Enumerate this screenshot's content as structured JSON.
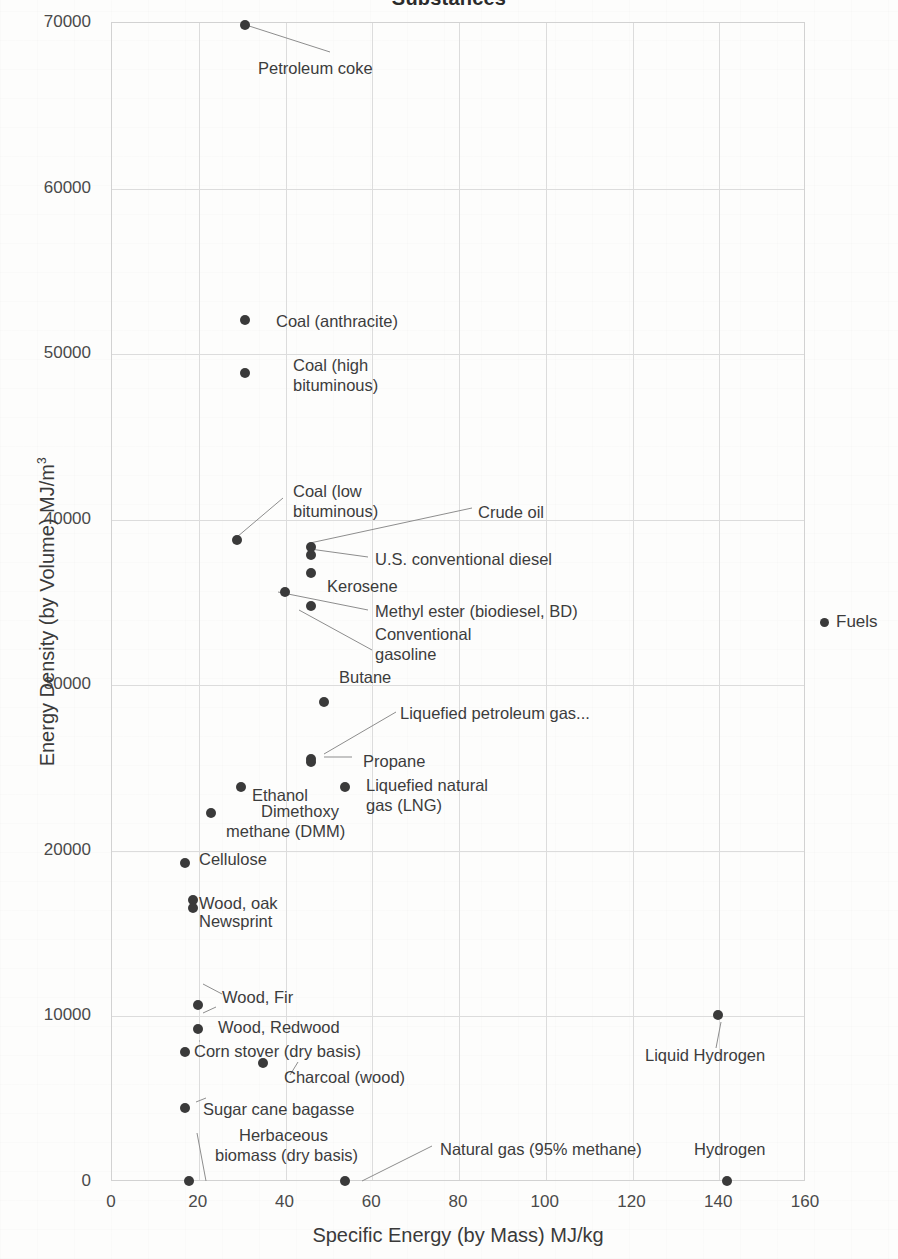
{
  "chart_data": {
    "type": "scatter",
    "title": "Substances",
    "xlabel": "Specific Energy  (by Mass)   MJ/kg",
    "ylabel": "Energy Density (by Volume)   MJ/m",
    "ylabel_sup": "3",
    "xlim": [
      0,
      160
    ],
    "ylim": [
      0,
      70000
    ],
    "xticks": [
      0,
      20,
      40,
      60,
      80,
      100,
      120,
      140,
      160
    ],
    "yticks": [
      0,
      10000,
      20000,
      30000,
      40000,
      50000,
      60000,
      70000
    ],
    "grid": true,
    "legend": {
      "position": "right",
      "entries": [
        "Fuels"
      ]
    },
    "series": [
      {
        "name": "Fuels",
        "color": "#3a3a3a",
        "points": [
          {
            "label": "Petroleum coke",
            "x": 31,
            "y": 69800
          },
          {
            "label": "Coal (anthracite)",
            "x": 31,
            "y": 52000
          },
          {
            "label": "Coal (high\nbituminous)",
            "x": 31,
            "y": 48800
          },
          {
            "label": "Coal (low\nbituminous)",
            "x": 29,
            "y": 38700
          },
          {
            "label": "Crude oil",
            "x": 46,
            "y": 38300
          },
          {
            "label": "U.S. conventional diesel",
            "x": 46,
            "y": 37800
          },
          {
            "label": "Kerosene",
            "x": 46,
            "y": 36700
          },
          {
            "label": "Methyl ester (biodiesel, BD)",
            "x": 40,
            "y": 35600
          },
          {
            "label": "Conventional\ngasoline",
            "x": 46,
            "y": 34700
          },
          {
            "label": "Butane",
            "x": 49,
            "y": 28900
          },
          {
            "label": "Liquefied petroleum gas...",
            "x": 46,
            "y": 25500
          },
          {
            "label": "Propane",
            "x": 46,
            "y": 25300
          },
          {
            "label": "Liquefied natural\ngas (LNG)",
            "x": 54,
            "y": 23800
          },
          {
            "label": "Ethanol",
            "x": 30,
            "y": 23800
          },
          {
            "label": "Dimethoxy\nmethane (DMM)",
            "x": 23,
            "y": 22200
          },
          {
            "label": "Cellulose",
            "x": 17,
            "y": 19200
          },
          {
            "label": "Wood, oak",
            "x": 19,
            "y": 17000
          },
          {
            "label": "Newsprint",
            "x": 19,
            "y": 16500
          },
          {
            "label": "Wood, Fir",
            "x": 20,
            "y": 10600
          },
          {
            "label": "Wood, Redwood",
            "x": 20,
            "y": 9200
          },
          {
            "label": "Corn stover (dry basis)",
            "x": 17,
            "y": 7800
          },
          {
            "label": "Charcoal (wood)",
            "x": 35,
            "y": 7100
          },
          {
            "label": "Liquid Hydrogen",
            "x": 140,
            "y": 10000
          },
          {
            "label": "Sugar cane bagasse",
            "x": 17,
            "y": 4400
          },
          {
            "label": "Herbaceous\nbiomass (dry basis)",
            "x": 18,
            "y": 0
          },
          {
            "label": "Natural gas (95% methane)",
            "x": 54,
            "y": 0
          },
          {
            "label": "Hydrogen",
            "x": 142,
            "y": 0
          }
        ]
      }
    ],
    "annotations": [
      {
        "text": "Petroleum coke",
        "x_px": 258,
        "y_px": 59,
        "align": "left"
      },
      {
        "text": "Coal (anthracite)",
        "x_px": 276,
        "y_px": 312,
        "align": "left"
      },
      {
        "text": "Coal (high",
        "x_px": 293,
        "y_px": 356,
        "align": "left"
      },
      {
        "text": "bituminous)",
        "x_px": 293,
        "y_px": 376,
        "align": "left"
      },
      {
        "text": "Coal (low",
        "x_px": 293,
        "y_px": 482,
        "align": "left"
      },
      {
        "text": "bituminous)",
        "x_px": 293,
        "y_px": 502,
        "align": "left"
      },
      {
        "text": "Crude oil",
        "x_px": 478,
        "y_px": 503,
        "align": "left"
      },
      {
        "text": "U.S. conventional diesel",
        "x_px": 375,
        "y_px": 550,
        "align": "left"
      },
      {
        "text": "Kerosene",
        "x_px": 327,
        "y_px": 577,
        "align": "left"
      },
      {
        "text": "Methyl ester (biodiesel, BD)",
        "x_px": 375,
        "y_px": 602,
        "align": "left"
      },
      {
        "text": "Conventional",
        "x_px": 375,
        "y_px": 625,
        "align": "left"
      },
      {
        "text": "gasoline",
        "x_px": 375,
        "y_px": 645,
        "align": "left"
      },
      {
        "text": "Butane",
        "x_px": 339,
        "y_px": 668,
        "align": "left"
      },
      {
        "text": "Liquefied petroleum gas...",
        "x_px": 400,
        "y_px": 704,
        "align": "left"
      },
      {
        "text": "Propane",
        "x_px": 363,
        "y_px": 752,
        "align": "left"
      },
      {
        "text": "Liquefied natural",
        "x_px": 366,
        "y_px": 776,
        "align": "left"
      },
      {
        "text": "gas (LNG)",
        "x_px": 366,
        "y_px": 796,
        "align": "left"
      },
      {
        "text": "Ethanol",
        "x_px": 252,
        "y_px": 786,
        "align": "left"
      },
      {
        "text": "Dimethoxy",
        "x_px": 261,
        "y_px": 802,
        "align": "left"
      },
      {
        "text": "methane (DMM)",
        "x_px": 226,
        "y_px": 822,
        "align": "left"
      },
      {
        "text": "Cellulose",
        "x_px": 199,
        "y_px": 850,
        "align": "left"
      },
      {
        "text": "Wood, oak",
        "x_px": 199,
        "y_px": 894,
        "align": "left"
      },
      {
        "text": "Newsprint",
        "x_px": 199,
        "y_px": 912,
        "align": "left"
      },
      {
        "text": "Wood, Fir",
        "x_px": 222,
        "y_px": 988,
        "align": "left"
      },
      {
        "text": "Wood, Redwood",
        "x_px": 218,
        "y_px": 1018,
        "align": "left"
      },
      {
        "text": "Corn stover (dry basis)",
        "x_px": 194,
        "y_px": 1042,
        "align": "left"
      },
      {
        "text": "Charcoal (wood)",
        "x_px": 284,
        "y_px": 1068,
        "align": "left"
      },
      {
        "text": "Liquid Hydrogen",
        "x_px": 645,
        "y_px": 1046,
        "align": "left"
      },
      {
        "text": "Sugar cane bagasse",
        "x_px": 203,
        "y_px": 1100,
        "align": "left"
      },
      {
        "text": "Herbaceous",
        "x_px": 239,
        "y_px": 1126,
        "align": "left"
      },
      {
        "text": "biomass (dry basis)",
        "x_px": 215,
        "y_px": 1146,
        "align": "left"
      },
      {
        "text": "Natural gas (95% methane)",
        "x_px": 440,
        "y_px": 1140,
        "align": "left"
      },
      {
        "text": "Hydrogen",
        "x_px": 694,
        "y_px": 1140,
        "align": "left"
      }
    ],
    "leaders": [
      [
        246,
        25,
        330,
        52
      ],
      [
        237,
        537,
        283,
        498
      ],
      [
        310,
        543,
        472,
        508
      ],
      [
        310,
        549,
        368,
        557
      ],
      [
        278,
        592,
        368,
        610
      ],
      [
        299,
        610,
        372,
        650
      ],
      [
        324,
        754,
        396,
        712
      ],
      [
        324,
        757,
        352,
        757
      ],
      [
        721,
        1022,
        716,
        1048
      ],
      [
        196,
        1102,
        206,
        1098
      ],
      [
        206,
        1181,
        197,
        1133
      ],
      [
        298,
        1062,
        290,
        1075
      ],
      [
        203,
        1013,
        216,
        1007
      ],
      [
        199,
        1041,
        200,
        1041
      ],
      [
        203,
        984,
        222,
        994
      ],
      [
        362,
        1181,
        432,
        1146
      ]
    ]
  }
}
